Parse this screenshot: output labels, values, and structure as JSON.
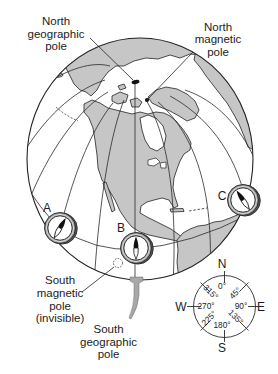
{
  "labels": {
    "north_geographic_pole": [
      "North",
      "geographic",
      "pole"
    ],
    "north_magnetic_pole": [
      "North",
      "magnetic",
      "pole"
    ],
    "south_magnetic_pole": [
      "South",
      "magnetic",
      "pole",
      "(invisible)"
    ],
    "south_geographic_pole": [
      "South",
      "geographic",
      "pole"
    ]
  },
  "compasses": [
    {
      "label": "A",
      "needle_angle_deg": 30,
      "needle_rotate": "rotate(30)"
    },
    {
      "label": "B",
      "needle_angle_deg": 0,
      "needle_rotate": "rotate(0)"
    },
    {
      "label": "C",
      "needle_angle_deg": -34,
      "needle_rotate": "rotate(-34)"
    }
  ],
  "compass_rose": {
    "north": "N",
    "east": "E",
    "south": "S",
    "west": "W",
    "degrees": [
      "0°",
      "45°",
      "90°",
      "135°",
      "180°",
      "225°",
      "270°",
      "315°"
    ]
  },
  "colors": {
    "land": "#c6c6c6",
    "ocean": "#ffffff",
    "outline": "#222222",
    "compass_ring": "#9a9a9a",
    "compass_ring_shadow": "#555555",
    "needle_north": "#111111",
    "south_pole_post": "#a8a8a8",
    "pole_marker": "#111111"
  }
}
